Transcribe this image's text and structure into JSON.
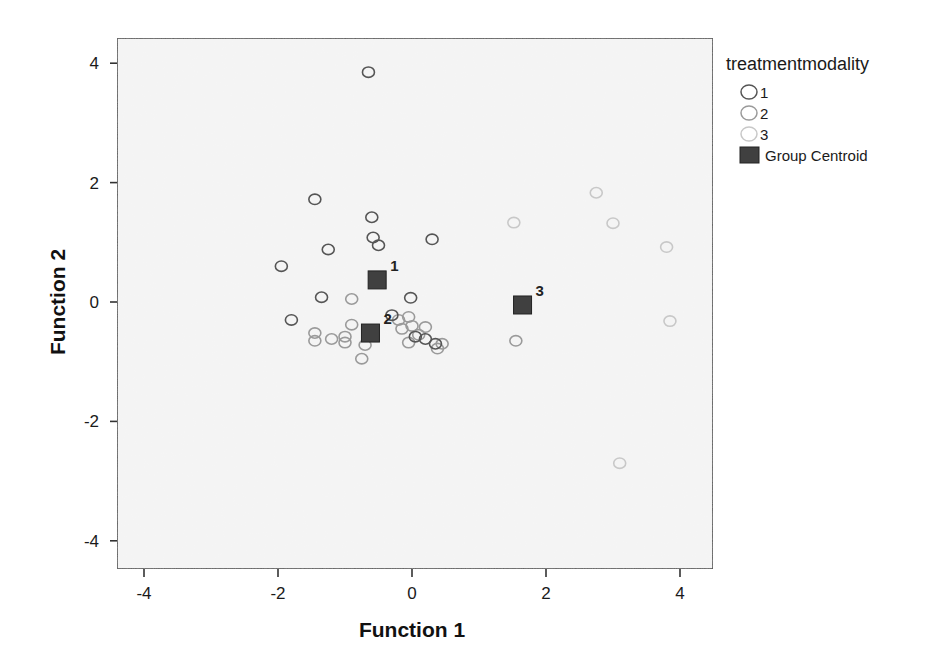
{
  "chart_data": {
    "type": "scatter",
    "title": "",
    "xlabel": "Function 1",
    "ylabel": "Function 2",
    "xlim": [
      -4.4,
      4.5
    ],
    "ylim": [
      -4.4,
      4.4
    ],
    "xticks": [
      -4,
      -2,
      0,
      2,
      4
    ],
    "yticks": [
      4,
      2,
      0,
      -2,
      -4
    ],
    "grid": false,
    "legend": {
      "title": "treatmentmodality",
      "position": "right",
      "entries": [
        {
          "label": "1",
          "marker": "circle",
          "color": "#555555"
        },
        {
          "label": "2",
          "marker": "circle",
          "color": "#9a9a9a"
        },
        {
          "label": "3",
          "marker": "circle",
          "color": "#c8c8c8"
        },
        {
          "label": "Group Centroid",
          "marker": "square",
          "color": "#404040"
        }
      ]
    },
    "series": [
      {
        "name": "1",
        "color": "#555555",
        "points": [
          {
            "x": -0.65,
            "y": 3.85
          },
          {
            "x": -1.45,
            "y": 1.72
          },
          {
            "x": -0.6,
            "y": 1.42
          },
          {
            "x": -0.58,
            "y": 1.08
          },
          {
            "x": -0.5,
            "y": 0.95
          },
          {
            "x": 0.3,
            "y": 1.05
          },
          {
            "x": -1.25,
            "y": 0.88
          },
          {
            "x": -1.95,
            "y": 0.6
          },
          {
            "x": -1.35,
            "y": 0.08
          },
          {
            "x": -0.02,
            "y": 0.07
          },
          {
            "x": -1.8,
            "y": -0.3
          },
          {
            "x": -0.3,
            "y": -0.22
          },
          {
            "x": 0.05,
            "y": -0.58
          },
          {
            "x": 0.2,
            "y": -0.62
          },
          {
            "x": 0.35,
            "y": -0.7
          }
        ]
      },
      {
        "name": "2",
        "color": "#9a9a9a",
        "points": [
          {
            "x": -0.9,
            "y": 0.05
          },
          {
            "x": -0.9,
            "y": -0.38
          },
          {
            "x": -1.45,
            "y": -0.52
          },
          {
            "x": -1.45,
            "y": -0.65
          },
          {
            "x": -1.2,
            "y": -0.62
          },
          {
            "x": -1.0,
            "y": -0.58
          },
          {
            "x": -1.0,
            "y": -0.68
          },
          {
            "x": -0.7,
            "y": -0.72
          },
          {
            "x": -0.75,
            "y": -0.95
          },
          {
            "x": -0.2,
            "y": -0.3
          },
          {
            "x": -0.05,
            "y": -0.25
          },
          {
            "x": -0.15,
            "y": -0.45
          },
          {
            "x": 0.0,
            "y": -0.4
          },
          {
            "x": 0.2,
            "y": -0.42
          },
          {
            "x": 0.1,
            "y": -0.55
          },
          {
            "x": -0.05,
            "y": -0.68
          },
          {
            "x": 0.45,
            "y": -0.7
          },
          {
            "x": 0.38,
            "y": -0.78
          },
          {
            "x": 1.55,
            "y": -0.65
          }
        ]
      },
      {
        "name": "3",
        "color": "#c8c8c8",
        "points": [
          {
            "x": 1.52,
            "y": 1.33
          },
          {
            "x": 2.75,
            "y": 1.83
          },
          {
            "x": 3.0,
            "y": 1.32
          },
          {
            "x": 3.8,
            "y": 0.92
          },
          {
            "x": 3.85,
            "y": -0.32
          },
          {
            "x": 3.1,
            "y": -2.7
          }
        ]
      }
    ],
    "centroids": [
      {
        "label": "1",
        "x": -0.52,
        "y": 0.37
      },
      {
        "label": "2",
        "x": -0.62,
        "y": -0.52
      },
      {
        "label": "3",
        "x": 1.65,
        "y": -0.05
      }
    ]
  }
}
